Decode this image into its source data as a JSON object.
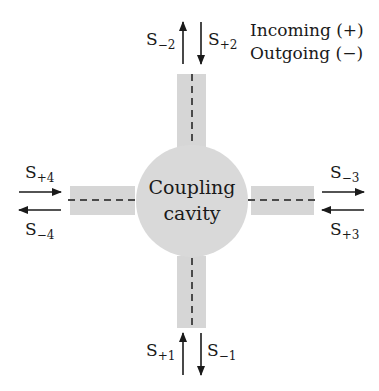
{
  "diagram": {
    "center_label": [
      "Coupling",
      "cavity"
    ],
    "legend": {
      "incoming": "Incoming (+)",
      "outgoing": "Outgoing (−)"
    },
    "ports": {
      "top": {
        "out_label_base": "S",
        "out_label_sub": "−2",
        "in_label_base": "S",
        "in_label_sub": "+2"
      },
      "bottom": {
        "in_label_base": "S",
        "in_label_sub": "+1",
        "out_label_base": "S",
        "out_label_sub": "−1"
      },
      "left": {
        "in_label_base": "S",
        "in_label_sub": "+4",
        "out_label_base": "S",
        "out_label_sub": "−4"
      },
      "right": {
        "out_label_base": "S",
        "out_label_sub": "−3",
        "in_label_base": "S",
        "in_label_sub": "+3"
      }
    },
    "colors": {
      "waveguide_fill": "#d6d6d6",
      "cavity_fill": "#d9d9d9",
      "line": "#1a1a1a",
      "dash": "#4a4a4a"
    }
  }
}
